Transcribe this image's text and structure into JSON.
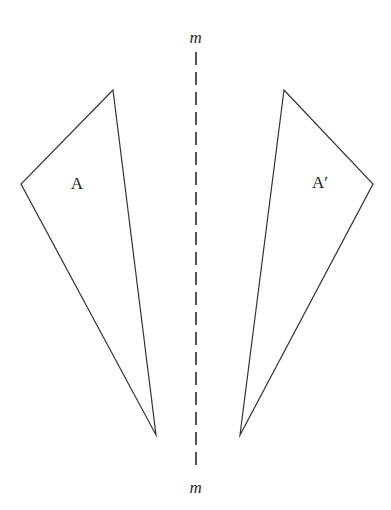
{
  "figure": {
    "type": "geometry-reflection-diagram",
    "width": 391,
    "height": 510,
    "background_color": "#ffffff",
    "stroke_color": "#333333",
    "mirror_color": "#555555"
  },
  "mirror": {
    "label_top": "m",
    "label_bottom": "m",
    "axis_x": 196,
    "start_y": 52,
    "end_y": 472,
    "dash_length": 13,
    "gap_length": 7,
    "stroke_width": 2
  },
  "shapes": [
    {
      "id": "triangle-a",
      "label": "A",
      "label_x": 77,
      "label_y": 183,
      "points": "113,90 21,184 156,435",
      "vertices": [
        {
          "name": "apex",
          "x": 113,
          "y": 90
        },
        {
          "name": "left",
          "x": 21,
          "y": 184
        },
        {
          "name": "bottom",
          "x": 156,
          "y": 435
        }
      ]
    },
    {
      "id": "triangle-a-prime",
      "label": "A′",
      "label_x": 320,
      "label_y": 182,
      "points": "284,90 373,184 240,435",
      "vertices": [
        {
          "name": "apex",
          "x": 284,
          "y": 90
        },
        {
          "name": "right",
          "x": 373,
          "y": 184
        },
        {
          "name": "bottom",
          "x": 240,
          "y": 435
        }
      ]
    }
  ]
}
